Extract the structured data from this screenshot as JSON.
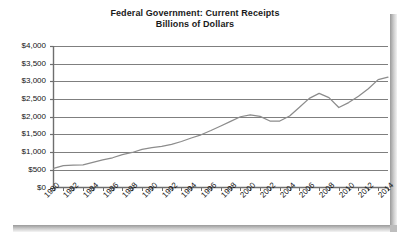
{
  "chart_data": {
    "type": "line",
    "title": "Federal Government: Current Receipts",
    "subtitle": "Billions of Dollars",
    "xlabel": "",
    "ylabel": "",
    "ylim": [
      0,
      4000
    ],
    "ytick_step": 500,
    "ytick_labels": [
      "$0",
      "$500",
      "$1,000",
      "$1,500",
      "$2,000",
      "$2,500",
      "$3,000",
      "$3,500",
      "$4,000"
    ],
    "ytick_values": [
      0,
      500,
      1000,
      1500,
      2000,
      2500,
      3000,
      3500,
      4000
    ],
    "xlim": [
      1980,
      2014
    ],
    "xtick_labels": [
      "1980",
      "1982",
      "1984",
      "1986",
      "1988",
      "1990",
      "1992",
      "1994",
      "1996",
      "1998",
      "2000",
      "2002",
      "2004",
      "2006",
      "2008",
      "2010",
      "2012",
      "2014"
    ],
    "xtick_values": [
      1980,
      1982,
      1984,
      1986,
      1988,
      1990,
      1992,
      1994,
      1996,
      1998,
      2000,
      2002,
      2004,
      2006,
      2008,
      2010,
      2012,
      2014
    ],
    "minor_ticks_every": 1,
    "grid": "horizontal",
    "legend": "none",
    "line_color": "#8c8c8c",
    "grid_color": "#7f7f7f",
    "axis_color": "#6e6e6e",
    "x": [
      1980,
      1981,
      1982,
      1983,
      1984,
      1985,
      1986,
      1987,
      1988,
      1989,
      1990,
      1991,
      1992,
      1993,
      1994,
      1995,
      1996,
      1997,
      1998,
      1999,
      2000,
      2001,
      2002,
      2003,
      2004,
      2005,
      2006,
      2007,
      2008,
      2009,
      2010,
      2011,
      2012,
      2013,
      2014
    ],
    "values": [
      540,
      620,
      630,
      640,
      710,
      780,
      840,
      930,
      990,
      1080,
      1130,
      1160,
      1220,
      1300,
      1400,
      1490,
      1610,
      1740,
      1870,
      2000,
      2050,
      2010,
      1880,
      1880,
      2020,
      2270,
      2520,
      2660,
      2540,
      2260,
      2400,
      2580,
      2790,
      3050,
      3120
    ]
  }
}
